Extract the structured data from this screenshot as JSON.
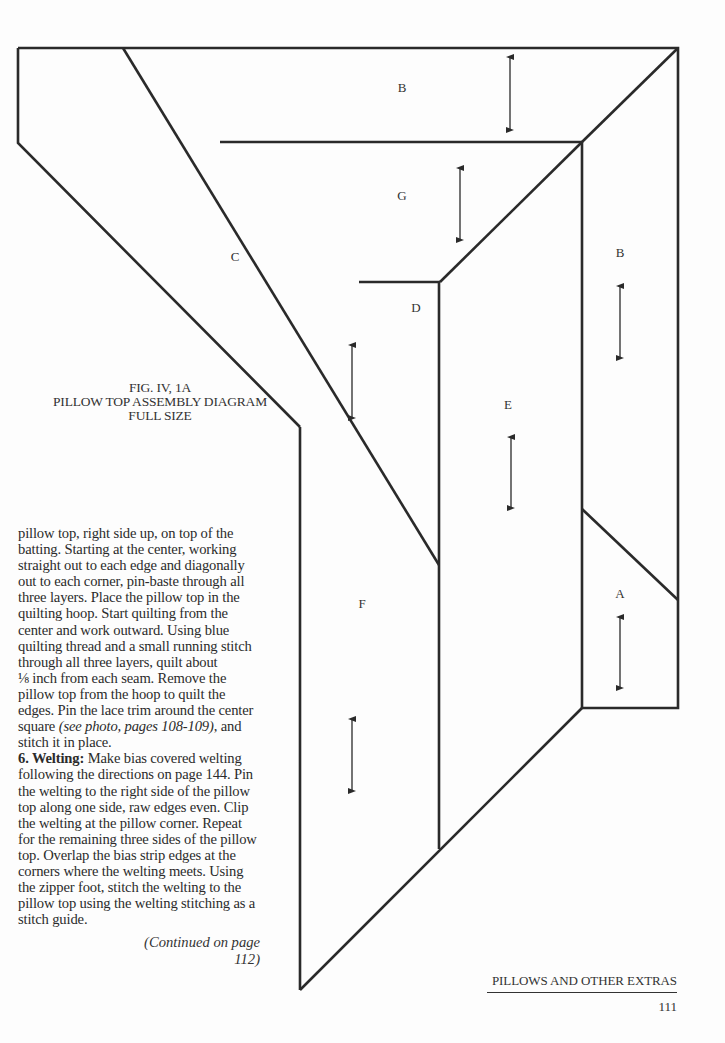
{
  "diagram": {
    "pieces": [
      {
        "id": "B-top",
        "label": "B",
        "label_pos": [
          402,
          88
        ],
        "grain_arrow": {
          "x": 510,
          "y1": 57,
          "y2": 130
        }
      },
      {
        "id": "G",
        "label": "G",
        "label_pos": [
          402,
          196
        ],
        "grain_arrow": {
          "x": 460,
          "y1": 168,
          "y2": 240
        }
      },
      {
        "id": "C",
        "label": "C",
        "label_pos": [
          235,
          257
        ],
        "grain_arrow": {
          "x": 352,
          "y1": 345,
          "y2": 418
        }
      },
      {
        "id": "D",
        "label": "D",
        "label_pos": [
          416,
          308
        ],
        "grain_arrow": null
      },
      {
        "id": "B-right",
        "label": "B",
        "label_pos": [
          620,
          253
        ],
        "grain_arrow": {
          "x": 620,
          "y1": 286,
          "y2": 358
        }
      },
      {
        "id": "E",
        "label": "E",
        "label_pos": [
          508,
          405
        ],
        "grain_arrow": {
          "x": 511,
          "y1": 437,
          "y2": 508
        }
      },
      {
        "id": "F",
        "label": "F",
        "label_pos": [
          362,
          604
        ],
        "grain_arrow": {
          "x": 352,
          "y1": 719,
          "y2": 791
        }
      },
      {
        "id": "A",
        "label": "A",
        "label_pos": [
          620,
          594
        ],
        "grain_arrow": {
          "x": 620,
          "y1": 617,
          "y2": 688
        }
      }
    ],
    "caption": {
      "line1": "FIG. IV, 1A",
      "line2": "PILLOW TOP ASSEMBLY DIAGRAM",
      "line3": "FULL SIZE"
    },
    "stroke_color": "#2a2a2a"
  },
  "body": {
    "lines_para1": [
      "pillow top, right side up, on top of the",
      "batting. Starting at the center, working",
      "straight out to each edge and diagonally",
      "out to each corner, pin-baste through all",
      "three layers. Place the pillow top in the",
      "quilting hoop. Start quilting from the",
      "center and work outward. Using blue",
      "quilting thread and a small running stitch",
      "through all three layers, quilt about",
      "⅛ inch from each seam. Remove the",
      "pillow top from the hoop to quilt the",
      "edges. Pin the lace trim around the center"
    ],
    "line_with_ref_pre": "square ",
    "line_with_ref_italic": "(see photo, pages 108-109)",
    "line_with_ref_post": ", and",
    "line_last_para1": "stitch it in place.",
    "step6_head": "6. Welting:",
    "step6_first_rest": " Make bias covered welting",
    "lines_step6": [
      "following the directions on page 144. Pin",
      "the welting to the right side of the pillow",
      "top along one side, raw edges even. Clip",
      "the welting at the pillow corner. Repeat",
      "for the remaining three sides of the pillow",
      "top. Overlap the bias strip edges at the",
      "corners where the welting meets. Using",
      "the zipper foot, stitch the welting to the",
      "pillow top using the welting stitching as a",
      "stitch guide."
    ],
    "continued": "(Continued on page 112)"
  },
  "footer": {
    "running_head": "PILLOWS AND OTHER EXTRAS",
    "page_number": "111"
  }
}
